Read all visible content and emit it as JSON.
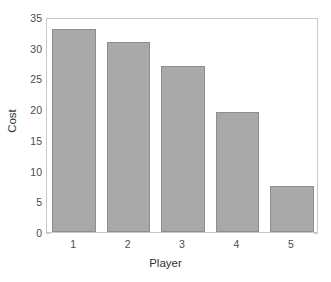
{
  "chart_data": {
    "type": "bar",
    "title": "",
    "xlabel": "Player",
    "ylabel": "Cost",
    "categories": [
      "1",
      "2",
      "3",
      "4",
      "5"
    ],
    "values": [
      33,
      31,
      27,
      19.5,
      7.5
    ],
    "series": [
      {
        "name": "Cost",
        "values": [
          33,
          31,
          27,
          19.5,
          7.5
        ]
      }
    ],
    "xlim": [
      0.5,
      5.5
    ],
    "ylim": [
      0,
      35
    ],
    "yticks": [
      0,
      5,
      10,
      15,
      20,
      25,
      30,
      35
    ],
    "ytick_labels": [
      "0",
      "5",
      "10",
      "15",
      "20",
      "25",
      "30",
      "35"
    ],
    "xticks": [
      1,
      2,
      3,
      4,
      5
    ],
    "xtick_labels": [
      "1",
      "2",
      "3",
      "4",
      "5"
    ],
    "grid": false,
    "legend": false,
    "legend_position": "none",
    "bar_color": "#a9a9a9",
    "bar_edge_color": "#8e8e8e",
    "axis_color": "#c8c8c8",
    "tick_label_color": "#4d4d4d",
    "axis_title_color": "#333333",
    "background_color": "#ffffff"
  }
}
